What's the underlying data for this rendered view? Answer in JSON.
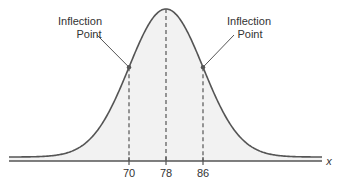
{
  "chart_data": {
    "type": "line",
    "title": "",
    "xlabel": "x",
    "ylabel": "",
    "distribution": {
      "kind": "normal",
      "mean": 78,
      "sd": 8
    },
    "xlim": [
      45,
      111
    ],
    "x_ticks": [
      70,
      78,
      86
    ],
    "x_tick_labels": [
      "70",
      "78",
      "86"
    ],
    "dashed_lines_at": [
      70,
      78,
      86
    ],
    "grid": false,
    "annotations": [
      {
        "text_line1": "Inflection",
        "text_line2": "Point",
        "x": 70,
        "side": "left"
      },
      {
        "text_line1": "Inflection",
        "text_line2": "Point",
        "x": 86,
        "side": "right"
      }
    ],
    "colors": {
      "curve": "#555555",
      "fill": "#f2f2f2",
      "axis": "#555555",
      "dash": "#555555",
      "point": "#555555"
    }
  },
  "labels": {
    "left_annotation_line1": "Inflection",
    "left_annotation_line2": "Point",
    "right_annotation_line1": "Inflection",
    "right_annotation_line2": "Point",
    "tick_70": "70",
    "tick_78": "78",
    "tick_86": "86",
    "axis_variable": "x"
  }
}
